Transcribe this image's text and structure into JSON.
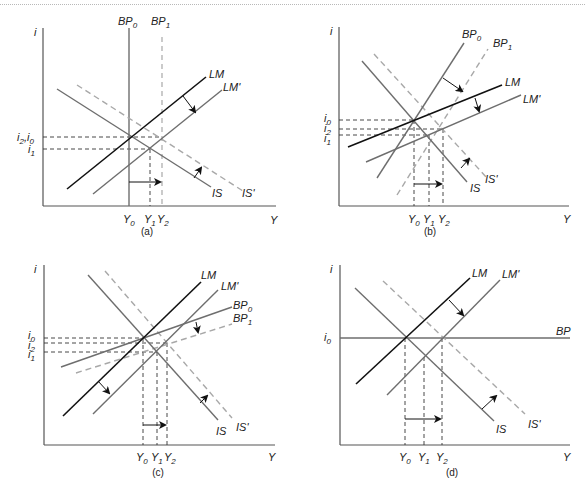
{
  "figure": {
    "panels": [
      {
        "id": "a",
        "caption": "(a)",
        "axis_y_label": "i",
        "axis_x_label": "Y",
        "curves": [
          "BP0 (vertical)",
          "BP1 (vertical, dashed)",
          "LM",
          "LM'",
          "IS",
          "IS' (dashed)"
        ],
        "labels": {
          "bp0": "BP",
          "bp0_sub": "0",
          "bp1": "BP",
          "bp1_sub": "1",
          "lm": "LM",
          "lm2": "LM'",
          "is": "IS",
          "is2": "IS'"
        },
        "i_ticks": [
          {
            "text": "i",
            "sub": "2",
            "extra": ",",
            "text2": "i",
            "sub2": "0"
          },
          {
            "text": "i",
            "sub": "1"
          }
        ],
        "y_ticks": [
          {
            "text": "Y",
            "sub": "0"
          },
          {
            "text": "Y",
            "sub": "1"
          },
          {
            "text": "Y",
            "sub": "2"
          }
        ]
      },
      {
        "id": "b",
        "caption": "(b)",
        "axis_y_label": "i",
        "axis_x_label": "Y",
        "labels": {
          "bp0": "BP",
          "bp0_sub": "0",
          "bp1": "BP",
          "bp1_sub": "1",
          "lm": "LM",
          "lm2": "LM'",
          "is": "IS",
          "is2": "IS'"
        },
        "i_ticks": [
          {
            "text": "i",
            "sub": "0"
          },
          {
            "text": "i",
            "sub": "2"
          },
          {
            "text": "i",
            "sub": "1"
          }
        ],
        "y_ticks": [
          {
            "text": "Y",
            "sub": "0"
          },
          {
            "text": "Y",
            "sub": "1"
          },
          {
            "text": "Y",
            "sub": "2"
          }
        ]
      },
      {
        "id": "c",
        "caption": "(c)",
        "axis_y_label": "i",
        "axis_x_label": "Y",
        "labels": {
          "bp0": "BP",
          "bp0_sub": "0",
          "bp1": "BP",
          "bp1_sub": "1",
          "lm": "LM",
          "lm2": "LM'",
          "is": "IS",
          "is2": "IS'"
        },
        "i_ticks": [
          {
            "text": "i",
            "sub": "0"
          },
          {
            "text": "i",
            "sub": "2"
          },
          {
            "text": "i",
            "sub": "1"
          }
        ],
        "y_ticks": [
          {
            "text": "Y",
            "sub": "0"
          },
          {
            "text": "Y",
            "sub": "1"
          },
          {
            "text": "Y",
            "sub": "2"
          }
        ]
      },
      {
        "id": "d",
        "caption": "(d)",
        "axis_y_label": "i",
        "axis_x_label": "Y",
        "labels": {
          "bp": "BP",
          "lm": "LM",
          "lm2": "LM'",
          "is": "IS",
          "is2": "IS'"
        },
        "i_ticks": [
          {
            "text": "i",
            "sub": "0"
          }
        ],
        "y_ticks": [
          {
            "text": "Y",
            "sub": "0"
          },
          {
            "text": "Y",
            "sub": "1"
          },
          {
            "text": "Y",
            "sub": "2"
          }
        ]
      }
    ],
    "colors": {
      "solid_dark": "#111111",
      "solid_gray": "#6e6e6e",
      "dashed_gray": "#a8a8a8",
      "guide_dashed": "#333333",
      "axis": "#555555"
    }
  }
}
